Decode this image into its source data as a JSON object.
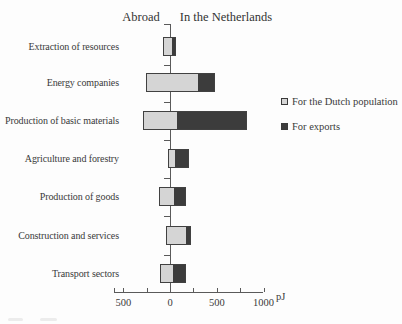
{
  "header": {
    "abroad": "Abroad",
    "netherlands": "In the Netherlands"
  },
  "axis": {
    "unit": "pJ",
    "tick_labels": [
      {
        "text": "500",
        "value": -500
      },
      {
        "text": "0",
        "value": 0
      },
      {
        "text": "500",
        "value": 500
      },
      {
        "text": "1000",
        "value": 1000
      }
    ],
    "drawn_tick_values": [
      -600,
      -500,
      -250,
      250,
      500,
      750,
      1000
    ],
    "range_pj": [
      -600,
      1000
    ]
  },
  "legend": [
    {
      "label": "For the Dutch population",
      "swatch": "light"
    },
    {
      "label": "For exports",
      "swatch": "dark"
    }
  ],
  "colors": {
    "light_series": "#d5d5d5",
    "dark_series": "#3c3c3c",
    "axis": "#5a5a5a",
    "text": "#3a3a3a",
    "background": "#fdfdfd"
  },
  "chart_data": {
    "type": "bar",
    "orientation": "horizontal-diverging",
    "unit": "PJ",
    "left_side_label": "Abroad",
    "right_side_label": "In the Netherlands",
    "legend_entries": [
      "For the Dutch population",
      "For exports"
    ],
    "axis_ticks_pj": [
      -500,
      0,
      500,
      1000
    ],
    "categories": [
      "Extraction of resources",
      "Energy companies",
      "Production of basic materials",
      "Agriculture and forestry",
      "Production of goods",
      "Construction and services",
      "Transport sectors"
    ],
    "bars": [
      {
        "category": "Extraction of resources",
        "start_pj": -75,
        "split_pj": 20,
        "end_pj": 65,
        "for_dutch_population_pj": 95,
        "for_exports_pj": 45
      },
      {
        "category": "Energy companies",
        "start_pj": -255,
        "split_pj": 295,
        "end_pj": 485,
        "for_dutch_population_pj": 550,
        "for_exports_pj": 190
      },
      {
        "category": "Production of basic materials",
        "start_pj": -285,
        "split_pj": 75,
        "end_pj": 820,
        "for_dutch_population_pj": 360,
        "for_exports_pj": 745
      },
      {
        "category": "Agriculture and forestry",
        "start_pj": -20,
        "split_pj": 55,
        "end_pj": 200,
        "for_dutch_population_pj": 75,
        "for_exports_pj": 145
      },
      {
        "category": "Production of goods",
        "start_pj": -120,
        "split_pj": 40,
        "end_pj": 170,
        "for_dutch_population_pj": 160,
        "for_exports_pj": 130
      },
      {
        "category": "Construction and services",
        "start_pj": -40,
        "split_pj": 170,
        "end_pj": 225,
        "for_dutch_population_pj": 210,
        "for_exports_pj": 55
      },
      {
        "category": "Transport sectors",
        "start_pj": -105,
        "split_pj": 35,
        "end_pj": 170,
        "for_dutch_population_pj": 140,
        "for_exports_pj": 135
      }
    ]
  }
}
